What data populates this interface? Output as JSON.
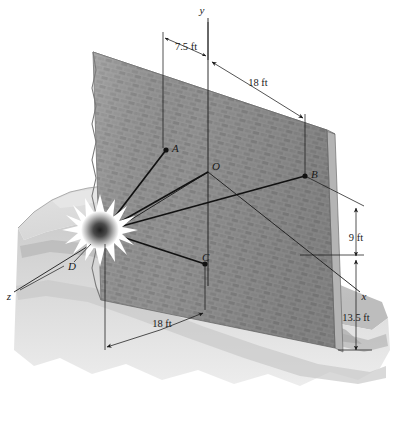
{
  "figure": {
    "type": "engineering-diagram",
    "background_color": "#ffffff",
    "line_color": "#1a1a1a"
  },
  "axes": {
    "y_label": "y",
    "x_label": "x",
    "z_label": "z",
    "origin_label": "O"
  },
  "points": [
    {
      "id": "A",
      "label": "A",
      "x": 166,
      "y": 150
    },
    {
      "id": "O",
      "label": "O",
      "x": 208,
      "y": 172
    },
    {
      "id": "B",
      "label": "B",
      "x": 305,
      "y": 176
    },
    {
      "id": "C",
      "label": "C",
      "x": 205,
      "y": 264
    },
    {
      "id": "D",
      "label": "D",
      "x": 100,
      "y": 230
    }
  ],
  "dimensions": [
    {
      "id": "top-left",
      "label": "7.5 ft"
    },
    {
      "id": "top-right",
      "label": "18 ft"
    },
    {
      "id": "right-upper",
      "label": "9 ft"
    },
    {
      "id": "right-lower",
      "label": "13.5 ft"
    },
    {
      "id": "bottom",
      "label": "18 ft"
    }
  ],
  "colors": {
    "wall_brick": "#8c8c8c",
    "wall_mortar": "#9d9d9d",
    "wall_edge": "#6f6f6f",
    "wall_side": "#a8a8a8",
    "ground_light": "#d8d8d8",
    "ground_mid": "#c2c2c2",
    "ground_shadow": "#b0b0b0",
    "blast_center": "#2a2a2a",
    "blast_outer": "#ffffff",
    "ink": "#1a1a1a"
  }
}
